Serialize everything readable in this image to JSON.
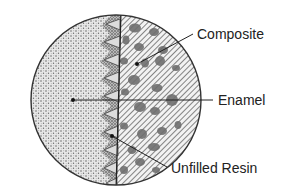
{
  "diagram": {
    "type": "cross-section",
    "labels": {
      "composite": "Composite",
      "enamel": "Enamel",
      "unfilled_resin": "Unfilled Resin"
    },
    "regions": [
      {
        "name": "enamel",
        "pattern": "stipple",
        "side": "left"
      },
      {
        "name": "unfilled-resin",
        "pattern": "light-grey-triangular-tags",
        "side": "interface"
      },
      {
        "name": "composite",
        "pattern": "diagonal-hatching-with-filler-particles",
        "side": "right"
      }
    ],
    "colors": {
      "outline": "#333333",
      "stipple_bg": "#e6e6e6",
      "stipple_dot": "#6a6a6a",
      "hatch_line": "#555555",
      "hatch_bg": "#f2f2f2",
      "particle": "#6e6e6e",
      "resin_tag": "#d9d9d9",
      "leader": "#222222",
      "text": "#222222"
    }
  }
}
